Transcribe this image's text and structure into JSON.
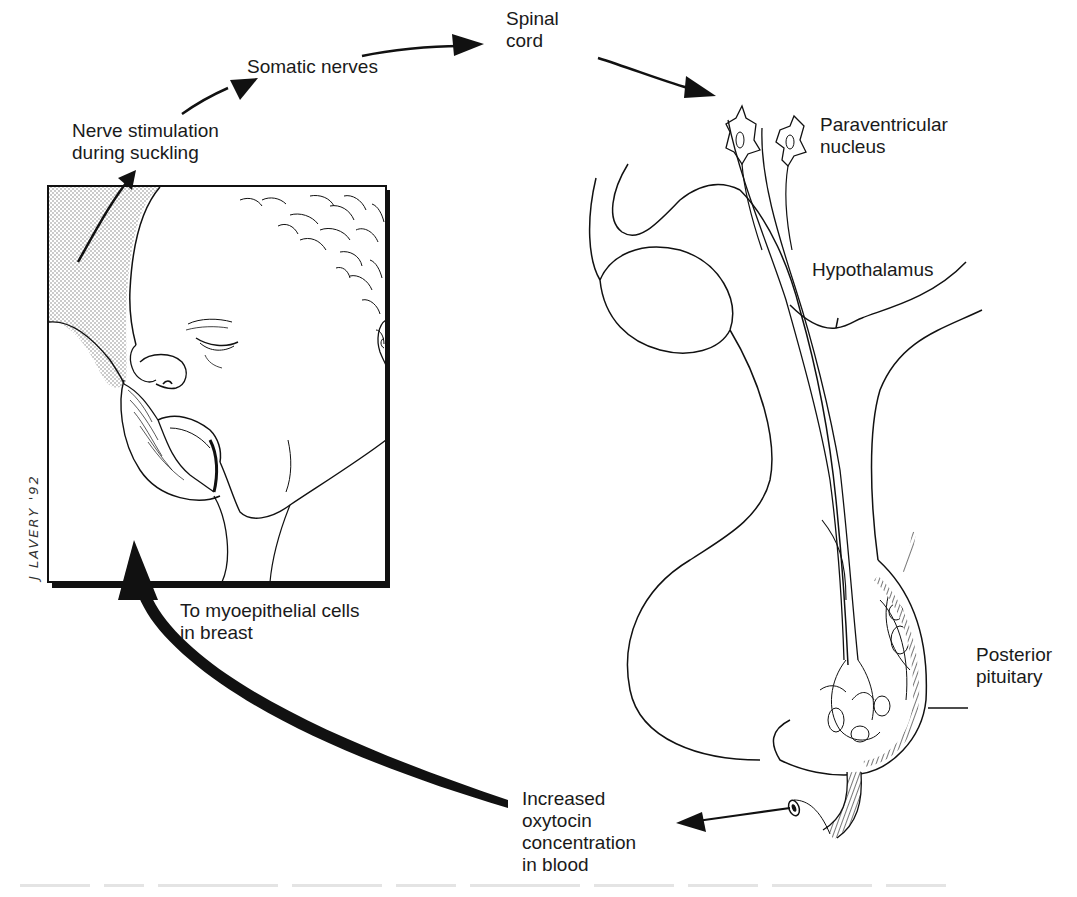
{
  "diagram": {
    "type": "oxytocin-milk-ejection-reflex",
    "labels": {
      "nerve_stimulation": [
        "Nerve stimulation",
        "during suckling"
      ],
      "somatic_nerves": "Somatic nerves",
      "spinal_cord": [
        "Spinal",
        "cord"
      ],
      "paraventricular_nucleus": [
        "Paraventricular",
        "nucleus"
      ],
      "hypothalamus": "Hypothalamus",
      "posterior_pituitary": [
        "Posterior",
        "pituitary"
      ],
      "increased_oxytocin": [
        "Increased",
        "oxytocin",
        "concentration",
        "in blood"
      ],
      "to_myoepithelial": [
        "To myoepithelial cells",
        "in breast"
      ]
    },
    "signature": "J LAVERY '92",
    "flow": [
      "Nerve stimulation during suckling",
      "Somatic nerves",
      "Spinal cord",
      "Paraventricular nucleus",
      "Hypothalamus",
      "Posterior pituitary",
      "Increased oxytocin concentration in blood",
      "To myoepithelial cells in breast"
    ],
    "colors": {
      "ink": "#1a1a1a",
      "stipple": "#b8b8b8",
      "background": "#ffffff"
    }
  }
}
